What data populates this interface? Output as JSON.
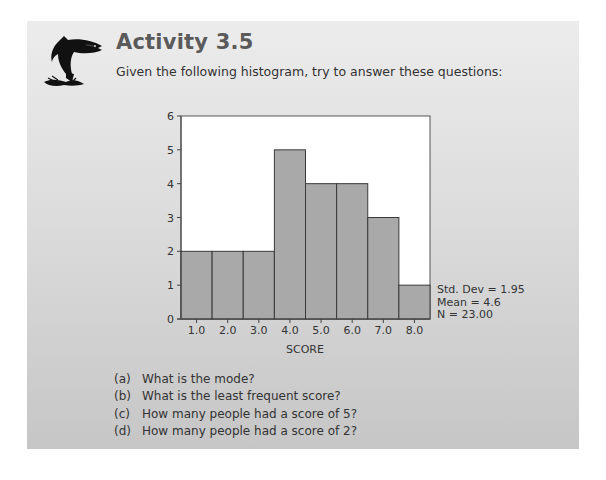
{
  "header": {
    "title": "Activity 3.5",
    "intro": "Given the following histogram, try to answer these questions:",
    "icon": "leaping-fish-icon"
  },
  "colors": {
    "bar_fill": "#a9a9a9",
    "bar_stroke": "#3a3a3a",
    "plot_bg": "#ffffff",
    "title": "#5a5a5a"
  },
  "chart_data": {
    "type": "bar",
    "title": "",
    "xlabel": "SCORE",
    "ylabel": "",
    "categories": [
      "1.0",
      "2.0",
      "3.0",
      "4.0",
      "5.0",
      "6.0",
      "7.0",
      "8.0"
    ],
    "values": [
      2,
      2,
      2,
      5,
      4,
      4,
      3,
      1
    ],
    "yticks": [
      0,
      1,
      2,
      3,
      4,
      5,
      6
    ],
    "ylim": [
      0,
      6
    ],
    "grid": false,
    "legend": null,
    "annotations": [
      "Std. Dev = 1.95",
      "Mean = 4.6",
      "N = 23.00"
    ]
  },
  "stats": {
    "std_dev": "Std. Dev = 1.95",
    "mean": "Mean = 4.6",
    "n": "N = 23.00"
  },
  "questions": [
    {
      "label": "(a)",
      "text": "What is the mode?"
    },
    {
      "label": "(b)",
      "text": "What is the least frequent score?"
    },
    {
      "label": "(c)",
      "text": "How many people had a score of 5?"
    },
    {
      "label": "(d)",
      "text": "How many people had a score of 2?"
    }
  ]
}
